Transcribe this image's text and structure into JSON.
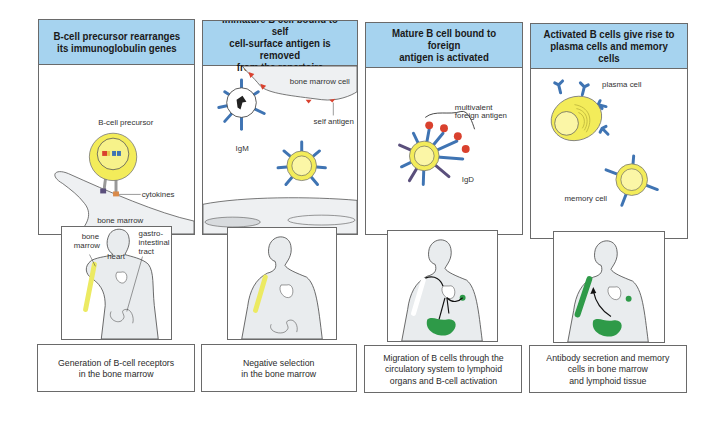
{
  "colors": {
    "header_bg": "#a6d3ef",
    "cell_yellow": "#f3ec5a",
    "cell_yellow_light": "#fbf6a6",
    "antibody_blue": "#3f74b3",
    "igd_purple": "#5a4f7c",
    "antigen_red": "#d9412e",
    "tissue_green": "#2e9a48",
    "marrow_yellow": "#ecea62",
    "body_gray": "#e9ecee",
    "stroma_gray": "#eef0f2",
    "border": "#6a6a6a"
  },
  "stages": [
    {
      "header": "B-cell precursor rearranges\nits immunoglobulin genes",
      "labels": {
        "cell": "B-cell precursor",
        "cytokines": "cytokines",
        "stroma": "bone marrow\nstromal cell",
        "stroma_line1": "bone marrow",
        "stroma_line2": "stromal cell"
      },
      "body_labels": {
        "marrow_line1": "bone",
        "marrow_line2": "marrow",
        "heart": "heart",
        "gi_line1": "gastro-",
        "gi_line2": "intestinal",
        "gi_line3": "tract"
      },
      "caption": "Generation of B-cell receptors\nin the bone marrow"
    },
    {
      "header": "Immature B cell bound to self\ncell-surface antigen is removed\nfrom the repertoire",
      "labels": {
        "marrow_cell": "bone marrow cell",
        "self_antigen": "self antigen",
        "igm": "IgM"
      },
      "caption": "Negative selection\nin the bone marrow"
    },
    {
      "header": "Mature B cell bound to foreign\nantigen is activated",
      "labels": {
        "antigen_line1": "multivalent",
        "antigen_line2": "foreign antigen",
        "igd": "IgD"
      },
      "caption": "Migration of B cells through the\ncirculatory system to lymphoid\norgans and B-cell activation"
    },
    {
      "header": "Activated B cells give rise to\nplasma cells and memory cells",
      "labels": {
        "plasma": "plasma cell",
        "memory": "memory cell"
      },
      "caption": "Antibody secretion and memory\ncells in bone marrow\nand lymphoid tissue"
    }
  ]
}
